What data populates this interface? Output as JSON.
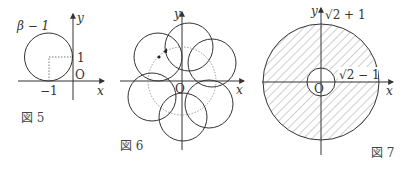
{
  "figures": [
    {
      "id": "fig5",
      "caption": "図 5",
      "labels": {
        "circle": "β − 1",
        "y_axis": "y",
        "x_axis": "x",
        "y_tick": "1",
        "x_tick": "−1",
        "origin": "O"
      }
    },
    {
      "id": "fig6",
      "caption": "図 6",
      "labels": {
        "y_axis": "y",
        "x_axis": "x",
        "origin": "O"
      }
    },
    {
      "id": "fig7",
      "caption": "図 7",
      "labels": {
        "y_axis": "y",
        "x_axis": "x",
        "origin": "O",
        "outer_radius": "√2 + 1",
        "inner_radius": "√2 − 1"
      }
    }
  ],
  "colors": {
    "stroke": "#333333",
    "dotted": "#999999",
    "hatch": "#888888"
  }
}
